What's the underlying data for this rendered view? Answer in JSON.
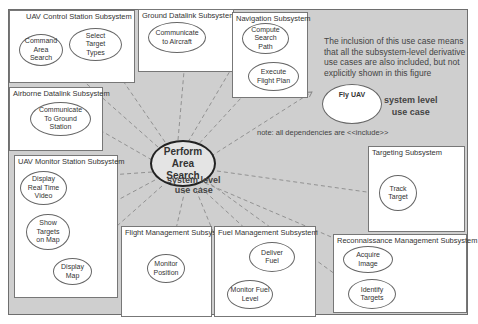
{
  "diagram": {
    "type": "uml-use-case",
    "main_use_case": {
      "label": "Perform\nArea\nSearch",
      "caption": "system level\nuse case"
    },
    "secondary_use_case": {
      "label": "Fly UAV",
      "caption": "system level\nuse case"
    },
    "notes": {
      "inclusion": "The inclusion of this use case means\nthat all the subsystem-level derivative\nuse cases are also included, but not\nexplicitly shown in this figure",
      "dependencies": "note: all dependencies are <<include>>"
    },
    "subsystems": [
      {
        "id": "uav-control-station",
        "title": "UAV Control Station Subsystem",
        "use_cases": [
          "Command\nArea\nSearch",
          "Select\nTarget\nTypes"
        ]
      },
      {
        "id": "ground-datalink",
        "title": "Ground Datalink Subsystem",
        "use_cases": [
          "Communicate\nto Aircraft"
        ]
      },
      {
        "id": "navigation",
        "title": "Navigation Subsystem",
        "use_cases": [
          "Compute\nSearch\nPath",
          "Execute\nFlight Plan"
        ]
      },
      {
        "id": "airborne-datalink",
        "title": "Airborne Datalink Subsystem",
        "use_cases": [
          "Communicate\nTo Ground\nStation"
        ]
      },
      {
        "id": "uav-monitor-station",
        "title": "UAV Monitor Station Subsystem",
        "use_cases": [
          "Display\nReal Time\nVideo",
          "Show\nTargets\non Map",
          "Display\nMap"
        ]
      },
      {
        "id": "targeting",
        "title": "Targeting Subsystem",
        "use_cases": [
          "Track\nTarget"
        ]
      },
      {
        "id": "flight-management",
        "title": "Flight Management Subsys",
        "use_cases": [
          "Monitor\nPosition"
        ]
      },
      {
        "id": "fuel-management",
        "title": "Fuel Management Subsystem",
        "use_cases": [
          "Deliver\nFuel",
          "Monitor Fuel\nLevel"
        ]
      },
      {
        "id": "reconnaissance-management",
        "title": "Reconnaissance Management Subsystem",
        "use_cases": [
          "Acquire\nImage",
          "Identify\nTargets"
        ]
      }
    ],
    "relationship": "include",
    "colors": {
      "background": "#cfcfcf",
      "box": "#ffffff",
      "line": "#888888",
      "main_border": "#222222"
    }
  }
}
